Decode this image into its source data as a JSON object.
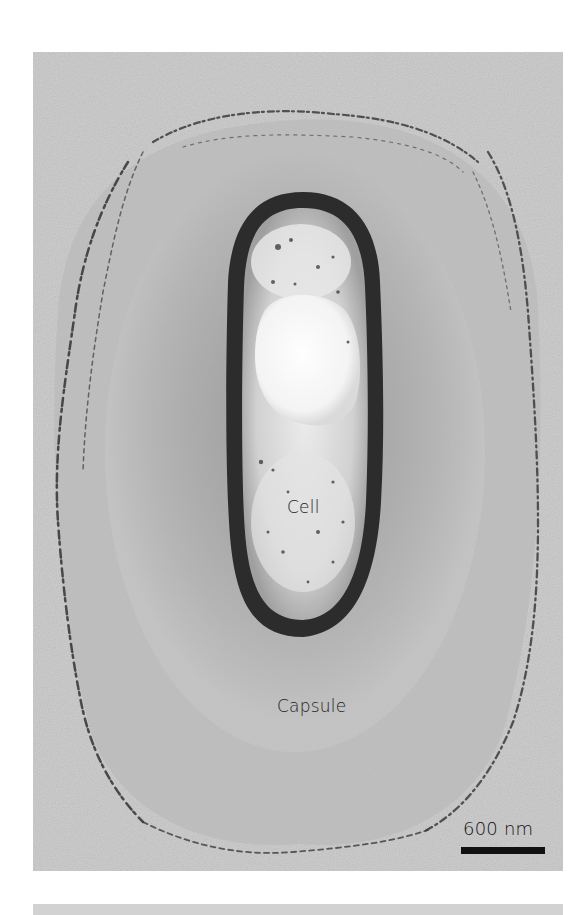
{
  "figure": {
    "labels": {
      "cell": "Cell",
      "capsule": "Capsule"
    },
    "scale_bar": {
      "text": "600 nm",
      "length_px": 84
    },
    "colors": {
      "background": "#c9c9c9",
      "capsule_halo": "#8f8f8f",
      "cell_wall": "#1e1e1e",
      "cytoplasm": "#d8d8d8",
      "inclusion": "#f7f7f7",
      "fibrils": "#3a3a3a"
    }
  }
}
